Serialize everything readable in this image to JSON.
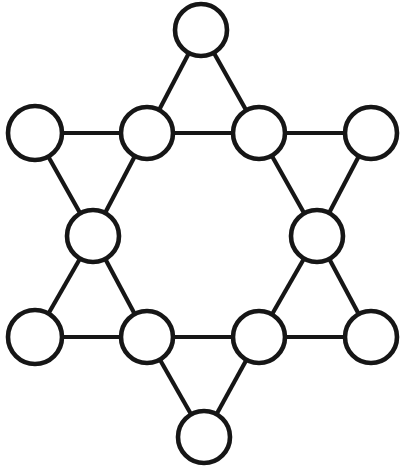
{
  "figure": {
    "canvas": {
      "width": 406,
      "height": 467
    },
    "style": {
      "background_color": "#ffffff",
      "line_color": "#161616",
      "node_fill_color": "#ffffff",
      "node_stroke_color": "#161616",
      "line_width": 4.2,
      "node_stroke_width": 4.6
    }
  },
  "diagram_data": {
    "type": "graph",
    "shape": "hexagram",
    "node_count": 12,
    "edge_count": 18,
    "node_radius": 26,
    "nodes": [
      {
        "id": "top",
        "label": "",
        "name": "node-top",
        "cx": 201,
        "cy": 30,
        "r": 26,
        "role": "star-point",
        "degree": 2
      },
      {
        "id": "upper-left-outer",
        "label": "",
        "name": "node-upper-left-outer",
        "cx": 35,
        "cy": 133,
        "r": 27,
        "role": "star-point",
        "degree": 2
      },
      {
        "id": "upper-left-inner",
        "label": "",
        "name": "node-upper-left-inner",
        "cx": 147,
        "cy": 133,
        "r": 26,
        "role": "hexagon-vertex",
        "degree": 4
      },
      {
        "id": "upper-right-inner",
        "label": "",
        "name": "node-upper-right-inner",
        "cx": 259,
        "cy": 133,
        "r": 26,
        "role": "hexagon-vertex",
        "degree": 4
      },
      {
        "id": "upper-right-outer",
        "label": "",
        "name": "node-upper-right-outer",
        "cx": 371,
        "cy": 133,
        "r": 26,
        "role": "star-point",
        "degree": 2
      },
      {
        "id": "middle-left",
        "label": "",
        "name": "node-middle-left",
        "cx": 93,
        "cy": 236,
        "r": 26,
        "role": "hexagon-vertex",
        "degree": 4
      },
      {
        "id": "middle-right",
        "label": "",
        "name": "node-middle-right",
        "cx": 317,
        "cy": 236,
        "r": 26,
        "role": "hexagon-vertex",
        "degree": 4
      },
      {
        "id": "lower-left-outer",
        "label": "",
        "name": "node-lower-left-outer",
        "cx": 35,
        "cy": 337,
        "r": 27,
        "role": "star-point",
        "degree": 2
      },
      {
        "id": "lower-left-inner",
        "label": "",
        "name": "node-lower-left-inner",
        "cx": 147,
        "cy": 337,
        "r": 26,
        "role": "hexagon-vertex",
        "degree": 4
      },
      {
        "id": "lower-right-inner",
        "label": "",
        "name": "node-lower-right-inner",
        "cx": 259,
        "cy": 337,
        "r": 26,
        "role": "hexagon-vertex",
        "degree": 4
      },
      {
        "id": "lower-right-outer",
        "label": "",
        "name": "node-lower-right-outer",
        "cx": 371,
        "cy": 337,
        "r": 26,
        "role": "star-point",
        "degree": 2
      },
      {
        "id": "bottom",
        "label": "",
        "name": "node-bottom",
        "cx": 204,
        "cy": 437,
        "r": 26,
        "role": "star-point",
        "degree": 2
      }
    ],
    "edges": [
      {
        "from": "top",
        "to": "upper-left-inner",
        "x1": 201,
        "y1": 30,
        "x2": 147,
        "y2": 133,
        "group": "triangle-top"
      },
      {
        "from": "top",
        "to": "upper-right-inner",
        "x1": 201,
        "y1": 30,
        "x2": 259,
        "y2": 133,
        "group": "triangle-top"
      },
      {
        "from": "upper-left-inner",
        "to": "upper-right-inner",
        "x1": 147,
        "y1": 133,
        "x2": 259,
        "y2": 133,
        "group": "hexagon"
      },
      {
        "from": "upper-left-outer",
        "to": "upper-left-inner",
        "x1": 35,
        "y1": 133,
        "x2": 147,
        "y2": 133,
        "group": "triangle-upper-left"
      },
      {
        "from": "upper-left-outer",
        "to": "middle-left",
        "x1": 35,
        "y1": 133,
        "x2": 93,
        "y2": 236,
        "group": "triangle-upper-left"
      },
      {
        "from": "upper-left-inner",
        "to": "middle-left",
        "x1": 147,
        "y1": 133,
        "x2": 93,
        "y2": 236,
        "group": "hexagon"
      },
      {
        "from": "upper-right-outer",
        "to": "upper-right-inner",
        "x1": 371,
        "y1": 133,
        "x2": 259,
        "y2": 133,
        "group": "triangle-upper-right"
      },
      {
        "from": "upper-right-outer",
        "to": "middle-right",
        "x1": 371,
        "y1": 133,
        "x2": 317,
        "y2": 236,
        "group": "triangle-upper-right"
      },
      {
        "from": "upper-right-inner",
        "to": "middle-right",
        "x1": 259,
        "y1": 133,
        "x2": 317,
        "y2": 236,
        "group": "hexagon"
      },
      {
        "from": "middle-left",
        "to": "lower-left-outer",
        "x1": 93,
        "y1": 236,
        "x2": 35,
        "y2": 337,
        "group": "triangle-lower-left"
      },
      {
        "from": "middle-left",
        "to": "lower-left-inner",
        "x1": 93,
        "y1": 236,
        "x2": 147,
        "y2": 337,
        "group": "hexagon"
      },
      {
        "from": "lower-left-outer",
        "to": "lower-left-inner",
        "x1": 35,
        "y1": 337,
        "x2": 147,
        "y2": 337,
        "group": "triangle-lower-left"
      },
      {
        "from": "middle-right",
        "to": "lower-right-outer",
        "x1": 317,
        "y1": 236,
        "x2": 371,
        "y2": 337,
        "group": "triangle-lower-right"
      },
      {
        "from": "middle-right",
        "to": "lower-right-inner",
        "x1": 317,
        "y1": 236,
        "x2": 259,
        "y2": 337,
        "group": "hexagon"
      },
      {
        "from": "lower-right-outer",
        "to": "lower-right-inner",
        "x1": 371,
        "y1": 337,
        "x2": 259,
        "y2": 337,
        "group": "triangle-lower-right"
      },
      {
        "from": "lower-left-inner",
        "to": "lower-right-inner",
        "x1": 147,
        "y1": 337,
        "x2": 259,
        "y2": 337,
        "group": "hexagon"
      },
      {
        "from": "lower-left-inner",
        "to": "bottom",
        "x1": 147,
        "y1": 337,
        "x2": 204,
        "y2": 437,
        "group": "triangle-bottom"
      },
      {
        "from": "lower-right-inner",
        "to": "bottom",
        "x1": 259,
        "y1": 337,
        "x2": 204,
        "y2": 437,
        "group": "triangle-bottom"
      }
    ]
  }
}
